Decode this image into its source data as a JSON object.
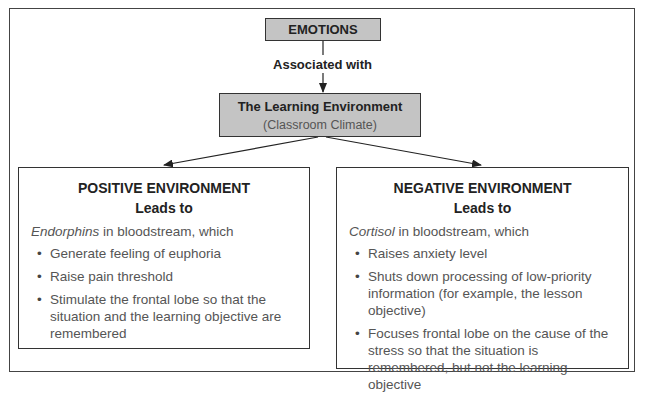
{
  "diagram": {
    "root": {
      "label": "EMOTIONS"
    },
    "connector": {
      "label": "Associated with"
    },
    "middle": {
      "title": "The Learning Environment",
      "subtitle": "(Classroom Climate)"
    },
    "colors": {
      "box_fill": "#c4c4c4",
      "border": "#333333",
      "body_text": "#555555",
      "heading_text": "#222222"
    },
    "positive": {
      "title": "POSITIVE ENVIRONMENT",
      "subtitle": "Leads to",
      "intro_term": "Endorphins",
      "intro_rest": " in bloodstream, which",
      "items": [
        "Generate feeling of euphoria",
        "Raise pain threshold",
        "Stimulate the frontal lobe so that the situation and the learning objective are remembered"
      ]
    },
    "negative": {
      "title": "NEGATIVE ENVIRONMENT",
      "subtitle": "Leads to",
      "intro_term": "Cortisol",
      "intro_rest": " in bloodstream, which",
      "items": [
        "Raises anxiety level",
        "Shuts down processing of low-priority information (for example, the lesson objective)",
        "Focuses frontal lobe on the cause of the stress so that the situation is remembered, but not the learning objective"
      ]
    }
  }
}
